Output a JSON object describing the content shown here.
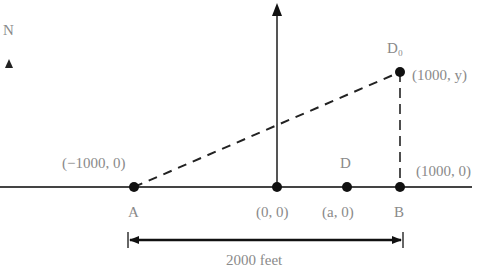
{
  "diagram": {
    "north_label": "N",
    "points": {
      "A": {
        "label": "A",
        "coord_label": "(−1000, 0)"
      },
      "O": {
        "coord_label": "(0, 0)"
      },
      "D": {
        "label": "D",
        "coord_label": "(a, 0)"
      },
      "B": {
        "label": "B",
        "coord_label": "(1000, 0)"
      },
      "D0": {
        "label": "D₀",
        "coord_label": "(1000, y)"
      }
    },
    "dimension": {
      "label": "2000 feet"
    },
    "colors": {
      "line": "#222222",
      "text": "#8a8a8a"
    }
  }
}
